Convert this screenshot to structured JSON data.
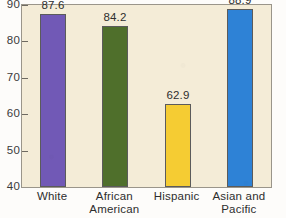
{
  "chart_data": {
    "type": "bar",
    "title": "",
    "subtitle": "",
    "xlabel": "",
    "ylabel": "",
    "categories": [
      "White",
      "African American",
      "Hispanic",
      "Asian and Pacific Islander"
    ],
    "category_lines": [
      [
        "White",
        ""
      ],
      [
        "African",
        "American"
      ],
      [
        "Hispanic",
        ""
      ],
      [
        "Asian and",
        "Pacific Islander"
      ]
    ],
    "values": [
      87.6,
      84.2,
      62.9,
      88.9
    ],
    "value_labels": [
      "87.6",
      "84.2",
      "62.9",
      "88.9"
    ],
    "bar_colors": [
      "#7159b6",
      "#4f6f2b",
      "#f5cc33",
      "#2e82d6"
    ],
    "ylim": [
      40,
      90
    ],
    "yticks": [
      40,
      50,
      60,
      70,
      80,
      90
    ],
    "ytick_labels": [
      "40",
      "50",
      "60",
      "70",
      "80",
      "90"
    ],
    "grid": false,
    "legend": "none",
    "plot_background": "#f4ecd7",
    "page_background": "#fdfcfa",
    "axis_color": "#9a958a"
  }
}
